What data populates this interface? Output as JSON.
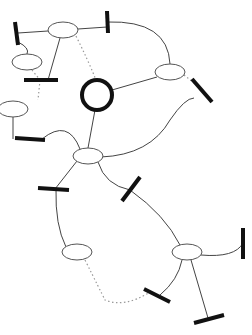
{
  "diagram": {
    "colors": {
      "edge": "#444444",
      "dotted_edge": "#999999",
      "node_stroke": "#555555",
      "hub_stroke": "#111111",
      "bar": "#111111",
      "background": "#ffffff"
    },
    "nodes": [
      {
        "id": "n-top",
        "type": "ellipse",
        "cx": 63,
        "cy": 30,
        "rx": 15,
        "ry": 8
      },
      {
        "id": "n-left-upper",
        "type": "ellipse",
        "cx": 27,
        "cy": 62,
        "rx": 15,
        "ry": 8
      },
      {
        "id": "n-left-middle",
        "type": "ellipse",
        "cx": 13,
        "cy": 109,
        "rx": 15,
        "ry": 8
      },
      {
        "id": "n-right-upper",
        "type": "ellipse",
        "cx": 170,
        "cy": 72,
        "rx": 15,
        "ry": 8
      },
      {
        "id": "hub",
        "type": "circle",
        "cx": 97,
        "cy": 95,
        "r": 15
      },
      {
        "id": "n-center",
        "type": "ellipse",
        "cx": 88,
        "cy": 156,
        "rx": 15,
        "ry": 8
      },
      {
        "id": "n-lower-left",
        "type": "ellipse",
        "cx": 77,
        "cy": 252,
        "rx": 15,
        "ry": 8
      },
      {
        "id": "n-lower-right",
        "type": "ellipse",
        "cx": 187,
        "cy": 252,
        "rx": 15,
        "ry": 8
      }
    ],
    "bars": [
      {
        "id": "b1",
        "x1": 15,
        "y1": 22,
        "x2": 18,
        "y2": 45
      },
      {
        "id": "b2",
        "x1": 107,
        "y1": 11,
        "x2": 108,
        "y2": 33
      },
      {
        "id": "b3",
        "x1": 24,
        "y1": 80,
        "x2": 58,
        "y2": 80
      },
      {
        "id": "b4",
        "x1": 15,
        "y1": 138,
        "x2": 45,
        "y2": 140
      },
      {
        "id": "b5",
        "x1": 192,
        "y1": 79,
        "x2": 212,
        "y2": 102
      },
      {
        "id": "b6",
        "x1": 38,
        "y1": 188,
        "x2": 69,
        "y2": 190
      },
      {
        "id": "b7",
        "x1": 122,
        "y1": 201,
        "x2": 140,
        "y2": 177
      },
      {
        "id": "b8",
        "x1": 243,
        "y1": 228,
        "x2": 243,
        "y2": 259
      },
      {
        "id": "b9",
        "x1": 144,
        "y1": 289,
        "x2": 170,
        "y2": 302
      },
      {
        "id": "b10",
        "x1": 194,
        "y1": 323,
        "x2": 224,
        "y2": 315
      }
    ],
    "edges": [
      {
        "style": "solid",
        "d": "M18 33 L48 31"
      },
      {
        "style": "solid",
        "d": "M78 29 L107 27"
      },
      {
        "style": "solid",
        "d": "M18 42 Q30 48 27 54"
      },
      {
        "style": "solid",
        "d": "M60 38 L48 80"
      },
      {
        "style": "dotted",
        "d": "M76 36 Q88 60 96 80"
      },
      {
        "style": "dotted",
        "d": "M32 70 L40 80"
      },
      {
        "style": "dotted",
        "d": "M40 80 L38 100"
      },
      {
        "style": "solid",
        "d": "M107 22 Q168 20 170 64"
      },
      {
        "style": "solid",
        "d": "M112 90 L157 77"
      },
      {
        "style": "dotted",
        "d": "M184 75 L198 86"
      },
      {
        "style": "solid",
        "d": "M13 117 L13 139"
      },
      {
        "style": "solid",
        "d": "M42 139 Q68 118 80 149"
      },
      {
        "style": "solid",
        "d": "M95 110 L88 148"
      },
      {
        "style": "solid",
        "d": "M101 157 Q150 155 170 120 Q185 98 194 98"
      },
      {
        "style": "solid",
        "d": "M77 161 L55 189"
      },
      {
        "style": "solid",
        "d": "M98 162 Q105 185 130 190"
      },
      {
        "style": "solid",
        "d": "M56 189 Q55 225 66 247"
      },
      {
        "style": "solid",
        "d": "M130 190 Q165 215 180 245"
      },
      {
        "style": "dotted",
        "d": "M85 260 Q100 290 105 300 Q125 308 150 292"
      },
      {
        "style": "solid",
        "d": "M182 260 Q178 280 160 295"
      },
      {
        "style": "solid",
        "d": "M191 260 L208 318"
      },
      {
        "style": "solid",
        "d": "M201 255 Q235 258 243 243"
      }
    ]
  }
}
